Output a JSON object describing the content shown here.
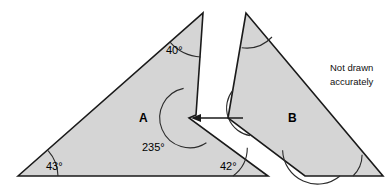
{
  "figure": {
    "note": {
      "line1": "Not drawn",
      "line2": "accurately"
    },
    "colors": {
      "shape_fill": "#d5d5d5",
      "outline": "#1a1a1a",
      "arc": "#2b2b2b",
      "background": "#ffffff",
      "text": "#000000"
    },
    "shapes": [
      {
        "id": "shape-a",
        "label": "A",
        "label_x": 139,
        "label_y": 122,
        "points": "18,176 203,13 196,115 189,118 268,176",
        "angles": [
          {
            "name": "angle-40",
            "value": "40°",
            "x": 166,
            "y": 54,
            "marked": true
          },
          {
            "name": "angle-235",
            "value": "235°",
            "x": 142,
            "y": 151,
            "marked": true
          },
          {
            "name": "angle-43",
            "value": "43°",
            "x": 46,
            "y": 170,
            "marked": true
          },
          {
            "name": "angle-42",
            "value": "42°",
            "x": 220,
            "y": 170,
            "marked": true
          }
        ]
      },
      {
        "id": "shape-b",
        "label": "B",
        "label_x": 288,
        "label_y": 122,
        "points": "246,13 228,118 305,176 383,176",
        "angles": [
          {
            "name": "angle-b-apex",
            "value": "",
            "marked": true
          },
          {
            "name": "angle-b-left",
            "value": "",
            "marked": true
          },
          {
            "name": "angle-b-bottom-left",
            "value": "",
            "marked": true
          },
          {
            "name": "angle-b-bottom-right",
            "value": "",
            "marked": true
          }
        ]
      }
    ],
    "pointer": {
      "name": "reflex-angle-pointer",
      "direction": "left",
      "from_x": 243,
      "to_x": 193,
      "y": 118
    }
  }
}
